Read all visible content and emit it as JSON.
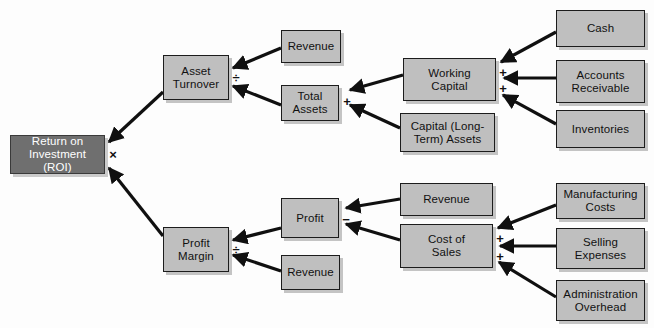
{
  "diagram": {
    "type": "tree-diagram",
    "canvas": {
      "width": 654,
      "height": 328
    },
    "colors": {
      "background": "#fdfdfd",
      "node_fill": "#bfbfbf",
      "root_fill": "#6f6f6f",
      "node_border": "#1c1c1c",
      "node_text": "#111111",
      "root_text": "#ffffff",
      "edge": "#101010"
    },
    "nodes": [
      {
        "id": "roi",
        "label": "Return on\nInvestment (ROI)",
        "x": 10,
        "y": 135,
        "w": 95,
        "h": 39,
        "root": true
      },
      {
        "id": "asset_turn",
        "label": "Asset\nTurnover",
        "x": 163,
        "y": 55,
        "w": 66,
        "h": 45,
        "root": false
      },
      {
        "id": "revenue_1",
        "label": "Revenue",
        "x": 281,
        "y": 30,
        "w": 60,
        "h": 33,
        "root": false
      },
      {
        "id": "total_assets",
        "label": "Total\nAssets",
        "x": 281,
        "y": 85,
        "w": 58,
        "h": 36,
        "root": false
      },
      {
        "id": "working_cap",
        "label": "Working\nCapital",
        "x": 403,
        "y": 58,
        "w": 93,
        "h": 43,
        "root": false
      },
      {
        "id": "capital_lt",
        "label": "Capital (Long-\nTerm) Assets",
        "x": 400,
        "y": 113,
        "w": 95,
        "h": 39,
        "root": false
      },
      {
        "id": "cash",
        "label": "Cash",
        "x": 556,
        "y": 10,
        "w": 89,
        "h": 37,
        "root": false
      },
      {
        "id": "ar",
        "label": "Accounts\nReceivable",
        "x": 556,
        "y": 60,
        "w": 89,
        "h": 43,
        "root": false
      },
      {
        "id": "inventories",
        "label": "Inventories",
        "x": 556,
        "y": 110,
        "w": 89,
        "h": 38,
        "root": false
      },
      {
        "id": "profit_marg",
        "label": "Profit\nMargin",
        "x": 163,
        "y": 227,
        "w": 66,
        "h": 45,
        "root": false
      },
      {
        "id": "profit",
        "label": "Profit",
        "x": 281,
        "y": 198,
        "w": 58,
        "h": 40,
        "root": false
      },
      {
        "id": "revenue_2",
        "label": "Revenue",
        "x": 281,
        "y": 255,
        "w": 59,
        "h": 35,
        "root": false
      },
      {
        "id": "revenue_3",
        "label": "Revenue",
        "x": 400,
        "y": 183,
        "w": 93,
        "h": 33,
        "root": false
      },
      {
        "id": "cost_sales",
        "label": "Cost of\nSales",
        "x": 400,
        "y": 224,
        "w": 93,
        "h": 44,
        "root": false
      },
      {
        "id": "mfg_costs",
        "label": "Manufacturing\nCosts",
        "x": 556,
        "y": 183,
        "w": 89,
        "h": 36,
        "root": false
      },
      {
        "id": "selling_exp",
        "label": "Selling\nExpenses",
        "x": 556,
        "y": 228,
        "w": 89,
        "h": 41,
        "root": false
      },
      {
        "id": "admin_over",
        "label": "Administration\nOverhead",
        "x": 556,
        "y": 280,
        "w": 89,
        "h": 41,
        "root": false
      }
    ],
    "operators": [
      {
        "id": "op_roi",
        "symbol": "×",
        "x": 107,
        "y": 148,
        "meaning": "multiply"
      },
      {
        "id": "op_at",
        "symbol": "÷",
        "x": 230,
        "y": 71,
        "meaning": "divide"
      },
      {
        "id": "op_ta",
        "symbol": "+",
        "x": 341,
        "y": 95,
        "meaning": "plus"
      },
      {
        "id": "op_wc_1",
        "symbol": "+",
        "x": 497,
        "y": 66,
        "meaning": "plus"
      },
      {
        "id": "op_wc_2",
        "symbol": "+",
        "x": 497,
        "y": 82,
        "meaning": "plus"
      },
      {
        "id": "op_pm",
        "symbol": "÷",
        "x": 230,
        "y": 243,
        "meaning": "divide"
      },
      {
        "id": "op_profit",
        "symbol": "−",
        "x": 340,
        "y": 213,
        "meaning": "minus"
      },
      {
        "id": "op_cos_1",
        "symbol": "+",
        "x": 494,
        "y": 232,
        "meaning": "plus"
      },
      {
        "id": "op_cos_2",
        "symbol": "+",
        "x": 494,
        "y": 250,
        "meaning": "plus"
      }
    ],
    "edges": [
      {
        "id": "e_at_roi",
        "from": "asset_turn",
        "to": "roi",
        "x1": 163,
        "y1": 92,
        "x2": 109,
        "y2": 142
      },
      {
        "id": "e_pm_roi",
        "from": "profit_marg",
        "to": "roi",
        "x1": 163,
        "y1": 236,
        "x2": 109,
        "y2": 168
      },
      {
        "id": "e_rev_at",
        "from": "revenue_1",
        "to": "asset_turn",
        "x1": 281,
        "y1": 48,
        "x2": 233,
        "y2": 68
      },
      {
        "id": "e_ta_at",
        "from": "total_assets",
        "to": "asset_turn",
        "x1": 281,
        "y1": 105,
        "x2": 233,
        "y2": 86
      },
      {
        "id": "e_wc_ta",
        "from": "working_cap",
        "to": "total_assets",
        "x1": 403,
        "y1": 75,
        "x2": 350,
        "y2": 90
      },
      {
        "id": "e_clt_ta",
        "from": "capital_lt",
        "to": "total_assets",
        "x1": 400,
        "y1": 128,
        "x2": 350,
        "y2": 105
      },
      {
        "id": "e_cash_wc",
        "from": "cash",
        "to": "working_cap",
        "x1": 556,
        "y1": 32,
        "x2": 501,
        "y2": 62
      },
      {
        "id": "e_ar_wc",
        "from": "ar",
        "to": "working_cap",
        "x1": 556,
        "y1": 78,
        "x2": 504,
        "y2": 78
      },
      {
        "id": "e_inv_wc",
        "from": "inventories",
        "to": "working_cap",
        "x1": 556,
        "y1": 124,
        "x2": 503,
        "y2": 95
      },
      {
        "id": "e_pf_pm",
        "from": "profit",
        "to": "profit_marg",
        "x1": 281,
        "y1": 228,
        "x2": 233,
        "y2": 240
      },
      {
        "id": "e_rev2_pm",
        "from": "revenue_2",
        "to": "profit_marg",
        "x1": 281,
        "y1": 271,
        "x2": 233,
        "y2": 255
      },
      {
        "id": "e_rev3_pf",
        "from": "revenue_3",
        "to": "profit",
        "x1": 400,
        "y1": 199,
        "x2": 346,
        "y2": 208
      },
      {
        "id": "e_cos_pf",
        "from": "cost_sales",
        "to": "profit",
        "x1": 400,
        "y1": 240,
        "x2": 346,
        "y2": 224
      },
      {
        "id": "e_mfg_cos",
        "from": "mfg_costs",
        "to": "cost_sales",
        "x1": 556,
        "y1": 205,
        "x2": 498,
        "y2": 228
      },
      {
        "id": "e_sell_cos",
        "from": "selling_exp",
        "to": "cost_sales",
        "x1": 556,
        "y1": 246,
        "x2": 500,
        "y2": 246
      },
      {
        "id": "e_admin_cos",
        "from": "admin_over",
        "to": "cost_sales",
        "x1": 556,
        "y1": 297,
        "x2": 499,
        "y2": 262
      }
    ]
  }
}
